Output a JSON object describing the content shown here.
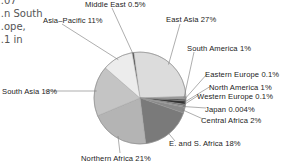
{
  "page_fragment": {
    "lines": [
      "…07",
      "…n South",
      "…ope,",
      "…1 in"
    ]
  },
  "chart_data": {
    "type": "pie",
    "title": "",
    "unit": "%",
    "slices": [
      {
        "label": "Middle East",
        "value": 0.5,
        "display": "Middle East  0.5%",
        "color": "#555555"
      },
      {
        "label": "East Asia",
        "value": 27,
        "display": "East Asia  27%",
        "color": "#dcdcdc"
      },
      {
        "label": "South America",
        "value": 1,
        "display": "South America  1%",
        "color": "#9a9a9a"
      },
      {
        "label": "Eastern Europe",
        "value": 0.1,
        "display": "Eastern Europe  0.1%",
        "color": "#444444"
      },
      {
        "label": "North America",
        "value": 1,
        "display": "North America  1%",
        "color": "#333333"
      },
      {
        "label": "Western Europe",
        "value": 0.1,
        "display": "Western Europe  0.1%",
        "color": "#666666"
      },
      {
        "label": "Japan",
        "value": 0.004,
        "display": "Japan  0.004%",
        "color": "#888888"
      },
      {
        "label": "Central Africa",
        "value": 2,
        "display": "Central Africa  2%",
        "color": "#8a8a8a"
      },
      {
        "label": "E. and S. Africa",
        "value": 18,
        "display": "E. and S. Africa  18%",
        "color": "#7a7a7a"
      },
      {
        "label": "Northern Africa",
        "value": 21,
        "display": "Northern Africa  21%",
        "color": "#b4b4b4"
      },
      {
        "label": "South Asia",
        "value": 18,
        "display": "South Asia  18%",
        "color": "#c4c4c4"
      },
      {
        "label": "Asia–Pacific",
        "value": 11,
        "display": "Asia–Pacific  11%",
        "color": "#ececec"
      }
    ],
    "legend": "none (callout labels)"
  }
}
